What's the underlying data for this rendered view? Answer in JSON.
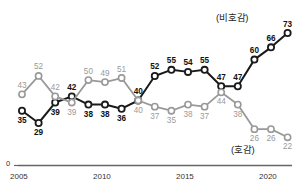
{
  "chart_data": {
    "type": "line",
    "title": "",
    "subtitle": "",
    "xlabel": "",
    "ylabel": "",
    "grid": false,
    "legend_position": "inline-endpoint",
    "x": [
      2005,
      2006,
      2007,
      2008,
      2009,
      2010,
      2011,
      2012,
      2013,
      2014,
      2015,
      2016,
      2017,
      2018,
      2019,
      2020,
      2021
    ],
    "xlim": [
      2005,
      2021
    ],
    "ylim": [
      0,
      80
    ],
    "xticks": [
      2005,
      2010,
      2015,
      2020
    ],
    "xtick_labels": [
      "2005",
      "2010",
      "2015",
      "2020"
    ],
    "yticks": [
      0
    ],
    "ytick_labels": [
      "0"
    ],
    "series": [
      {
        "name": "비호감",
        "color": "#1a1a1a",
        "marker": "open-circle",
        "values": [
          35,
          29,
          39,
          42,
          38,
          38,
          36,
          40,
          52,
          55,
          54,
          55,
          47,
          47,
          60,
          66,
          73
        ]
      },
      {
        "name": "호감",
        "color": "#999999",
        "marker": "open-circle",
        "values": [
          43,
          52,
          42,
          39,
          50,
          49,
          51,
          40,
          37,
          35,
          38,
          37,
          44,
          38,
          26,
          26,
          22
        ]
      }
    ],
    "annotations": {
      "unfavorable_label": "(비호감)",
      "favorable_label": "(호감)",
      "zero_label": "0"
    }
  },
  "axis": {
    "zero_label": "0",
    "tick_2005": "2005",
    "tick_2010": "2010",
    "tick_2015": "2015",
    "tick_2020": "2020"
  },
  "labels": {
    "unfavorable": "(비호감)",
    "favorable": "(호감)"
  },
  "colors": {
    "unfavorable_line": "#1a1a1a",
    "favorable_line": "#999999",
    "axis": "#555555",
    "background": "#ffffff"
  }
}
